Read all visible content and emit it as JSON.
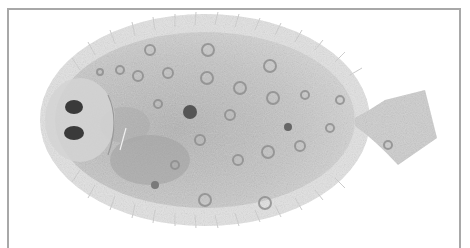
{
  "image": {
    "subject": "flatfish (flounder) specimen, eyed side, grayscale",
    "orientation": "head left, tail right",
    "colors": {
      "background": "#ffffff",
      "frame": "#a8a8a8",
      "body": "#c4c4c4",
      "fins": "#dcdcdc",
      "spots": "#8a8a8a",
      "eyes": "#3a3a3a"
    }
  }
}
